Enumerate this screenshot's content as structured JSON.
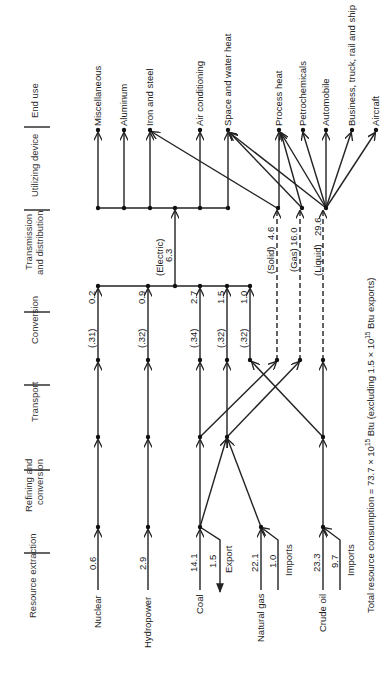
{
  "stages": [
    {
      "label": "Resource extraction"
    },
    {
      "label": "Refining and",
      "label2": "conversion"
    },
    {
      "label": "Transport"
    },
    {
      "label": "Conversion"
    },
    {
      "label": "Transmission",
      "label2": "and distribution"
    },
    {
      "label": "Utilizing device"
    },
    {
      "label": "End use"
    }
  ],
  "resources": [
    {
      "name": "Nuclear",
      "value": "0.6"
    },
    {
      "name": "Hydropower",
      "value": "2.9"
    },
    {
      "name": "Coal",
      "value": "14.1",
      "side_value": "1.5",
      "side_label": "Export"
    },
    {
      "name": "Natural gas",
      "value": "22.1",
      "side_value": "1.0",
      "side_label": "Imports"
    },
    {
      "name": "Crude oil",
      "value": "23.3",
      "side_value": "9.7",
      "side_label": "Imports"
    }
  ],
  "conversion": [
    {
      "efficiency": "(.31)",
      "output": "0.2"
    },
    {
      "efficiency": "(.32)",
      "output": "0.9"
    },
    {
      "efficiency": "(.34)",
      "output": "2.7"
    },
    {
      "efficiency": "(.32)",
      "output": "1.5"
    },
    {
      "efficiency": "(.32)",
      "output": "1.0"
    }
  ],
  "distribution": [
    {
      "label": "(Electric)",
      "value": "6.3"
    },
    {
      "label": "(Solid)",
      "value": "4.6"
    },
    {
      "label": "(Gas)",
      "value": "16.0"
    },
    {
      "label": "(Liquid)",
      "value": "29.6"
    }
  ],
  "end_uses": [
    "Miscellaneous",
    "Aluminum",
    "Iron and steel",
    "Air conditioning",
    "Space and water heat",
    "Process heat",
    "Petrochemicals",
    "Automobile",
    "Business, truck, rail and ship",
    "Aircraft"
  ],
  "footer": {
    "text": "Total resource consumption = 73.7 × 10",
    "sup": "15",
    "text2": " Btu (excluding 1.5 × 10",
    "sup2": "15",
    "text3": " Btu  exports)"
  }
}
